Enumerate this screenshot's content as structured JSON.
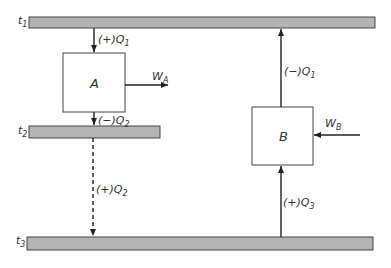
{
  "diagram": {
    "reservoirs": [
      {
        "id": "t1",
        "label": "t",
        "sub": "1"
      },
      {
        "id": "t2",
        "label": "t",
        "sub": "2"
      },
      {
        "id": "t3",
        "label": "t",
        "sub": "3"
      }
    ],
    "engines": [
      {
        "id": "A",
        "label": "A"
      },
      {
        "id": "B",
        "label": "B"
      }
    ],
    "flows": [
      {
        "id": "q1_into_A",
        "prefix": "(+)Q",
        "sub": "1"
      },
      {
        "id": "q2_out_A",
        "prefix": "(−)Q",
        "sub": "2"
      },
      {
        "id": "q2_into_t3",
        "prefix": "(+)Q",
        "sub": "2"
      },
      {
        "id": "q1_out_B",
        "prefix": "(−)Q",
        "sub": "1"
      },
      {
        "id": "q3_into_B",
        "prefix": "(+)Q",
        "sub": "3"
      }
    ],
    "work": [
      {
        "id": "WA",
        "label": "W",
        "sub": "A"
      },
      {
        "id": "WB",
        "label": "W",
        "sub": "B"
      }
    ],
    "colors": {
      "reservoir_fill": "#b4b4b4",
      "line": "#222222"
    }
  }
}
